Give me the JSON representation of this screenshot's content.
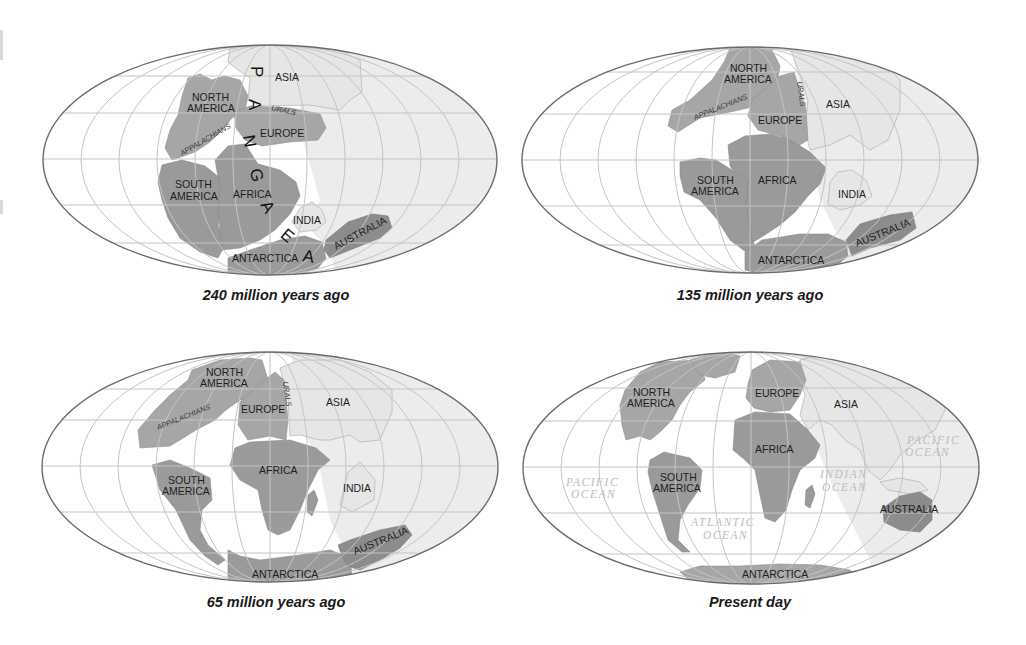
{
  "figure": {
    "colors": {
      "background": "#ffffff",
      "ocean": "#ffffff",
      "land_dark": "#9a9a9a",
      "land_light": "#e6e6e6",
      "grid": "#c4c4c4",
      "border": "#6a6a6a",
      "ocean_label": "#bdbdbd",
      "text": "#1e1e1e"
    }
  },
  "maps": [
    {
      "caption": "240 million years ago",
      "supercontinent_letters": [
        "P",
        "A",
        "N",
        "G",
        "A",
        "E",
        "A"
      ],
      "labels": {
        "asia": "ASIA",
        "north_america_1": "NORTH",
        "north_america_2": "AMERICA",
        "urals": "URALS",
        "appalachians": "APPALACHIANS",
        "europe": "EUROPE",
        "south_america_1": "SOUTH",
        "south_america_2": "AMERICA",
        "africa": "AFRICA",
        "india": "INDIA",
        "australia": "AUSTRALIA",
        "antarctica": "ANTARCTICA"
      }
    },
    {
      "caption": "135 million years ago",
      "labels": {
        "north_america_1": "NORTH",
        "north_america_2": "AMERICA",
        "urals": "URALS",
        "appalachians": "APPALACHIANS",
        "asia": "ASIA",
        "europe": "EUROPE",
        "south_america_1": "SOUTH",
        "south_america_2": "AMERICA",
        "africa": "AFRICA",
        "india": "INDIA",
        "australia": "AUSTRALIA",
        "antarctica": "ANTARCTICA"
      }
    },
    {
      "caption": "65 million years ago",
      "labels": {
        "north_america_1": "NORTH",
        "north_america_2": "AMERICA",
        "urals": "URALS",
        "appalachians": "APPALACHIANS",
        "europe": "EUROPE",
        "asia": "ASIA",
        "africa": "AFRICA",
        "south_america_1": "SOUTH",
        "south_america_2": "AMERICA",
        "india": "INDIA",
        "australia": "AUSTRALIA",
        "antarctica": "ANTARCTICA"
      }
    },
    {
      "caption": "Present day",
      "labels": {
        "north_america_1": "NORTH",
        "north_america_2": "AMERICA",
        "europe": "EUROPE",
        "asia": "ASIA",
        "africa": "AFRICA",
        "south_america_1": "SOUTH",
        "south_america_2": "AMERICA",
        "australia": "AUSTRALIA",
        "antarctica": "ANTARCTICA"
      },
      "oceans": {
        "pacific_west_1": "PACIFIC",
        "pacific_west_2": "OCEAN",
        "pacific_east_1": "PACIFIC",
        "pacific_east_2": "OCEAN",
        "atlantic_1": "ATLANTIC",
        "atlantic_2": "OCEAN",
        "indian_1": "INDIAN",
        "indian_2": "OCEAN"
      }
    }
  ]
}
